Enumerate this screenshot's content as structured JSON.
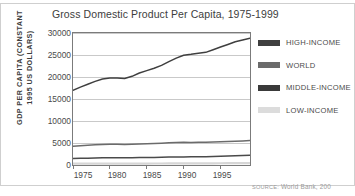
{
  "chart_data": {
    "type": "line",
    "title": "Gross Domestic Product Per Capita, 1975-1999",
    "xlabel": "",
    "ylabel": "GDP PER CAPITA (CONSTANT 1995 US DOLLARS)",
    "ylabel_line1": "GDP PER CAPITA (CONSTANT",
    "ylabel_line2": "1995 US DOLLARS)",
    "xlim": [
      1975,
      1999
    ],
    "ylim": [
      0,
      30000
    ],
    "grid": true,
    "legend_position": "right",
    "ytick_labels": [
      "30000",
      "25000",
      "20000",
      "15000",
      "10000",
      "5000",
      "0"
    ],
    "ytick_values": [
      30000,
      25000,
      20000,
      15000,
      10000,
      5000,
      0
    ],
    "xtick_labels": [
      "1975",
      "1980",
      "1985",
      "1990",
      "1995"
    ],
    "xtick_values": [
      1975,
      1980,
      1985,
      1990,
      1995
    ],
    "x": [
      1975,
      1976,
      1977,
      1978,
      1979,
      1980,
      1981,
      1982,
      1983,
      1984,
      1985,
      1986,
      1987,
      1988,
      1989,
      1990,
      1991,
      1992,
      1993,
      1994,
      1995,
      1996,
      1997,
      1998,
      1999
    ],
    "series": [
      {
        "name": "HIGH-INCOME",
        "color": "#3f3f3f",
        "values": [
          17000,
          17700,
          18350,
          19000,
          19550,
          19750,
          19800,
          19650,
          20150,
          20900,
          21450,
          22000,
          22650,
          23500,
          24300,
          24950,
          25150,
          25400,
          25600,
          26200,
          26800,
          27400,
          28000,
          28400,
          28800
        ]
      },
      {
        "name": "WORLD",
        "color": "#6b6b6b",
        "values": [
          4250,
          4400,
          4500,
          4600,
          4680,
          4700,
          4720,
          4650,
          4700,
          4780,
          4830,
          4880,
          4950,
          5050,
          5120,
          5150,
          5130,
          5150,
          5180,
          5250,
          5300,
          5350,
          5420,
          5480,
          5560
        ]
      },
      {
        "name": "MIDDLE-INCOME",
        "color": "#4a4a4a",
        "values": [
          1500,
          1530,
          1560,
          1590,
          1620,
          1630,
          1640,
          1630,
          1650,
          1680,
          1700,
          1720,
          1750,
          1790,
          1820,
          1840,
          1850,
          1870,
          1900,
          1950,
          2000,
          2060,
          2120,
          2160,
          2200
        ]
      },
      {
        "name": "LOW-INCOME",
        "color": "#d6d6d6",
        "values": [
          290,
          295,
          300,
          305,
          310,
          312,
          315,
          318,
          322,
          328,
          333,
          338,
          344,
          350,
          356,
          360,
          364,
          370,
          377,
          386,
          395,
          404,
          413,
          420,
          428
        ]
      }
    ]
  },
  "legend": {
    "items": [
      {
        "label": "HIGH-INCOME",
        "color": "#3f3f3f"
      },
      {
        "label": "WORLD",
        "color": "#6b6b6b"
      },
      {
        "label": "MIDDLE-INCOME",
        "color": "#3a3a3a"
      },
      {
        "label": "LOW-INCOME",
        "color": "#dcdcdc"
      }
    ]
  },
  "source": {
    "prefix": "source:",
    "text": "World Bank, 200"
  }
}
